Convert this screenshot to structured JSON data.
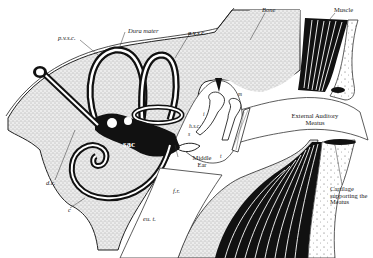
{
  "figure": {
    "colors": {
      "stipple": "#d9d9d9",
      "ink": "#111111",
      "paper": "#ffffff"
    }
  },
  "labels": {
    "dura_mater": "Dura mater",
    "pvsc": "p.v.s.c.",
    "avsc": "a.v.s.c.",
    "bone": "Bone",
    "muscle": "Muscle",
    "dc": "d.c.",
    "sac": "sac",
    "hsc": "h.s.c.",
    "s": "s",
    "i": "i",
    "m": "m",
    "t": "t",
    "middle_ear_1": "Middle",
    "middle_ear_2": "Ear",
    "ext_meatus_1": "External Auditory",
    "ext_meatus_2": "Meatus",
    "fr": "f.r.",
    "c": "c",
    "eut": "eu. t.",
    "cartilage_1": "Cartilage",
    "cartilage_2": "supporting the",
    "cartilage_3": "Meatus"
  }
}
